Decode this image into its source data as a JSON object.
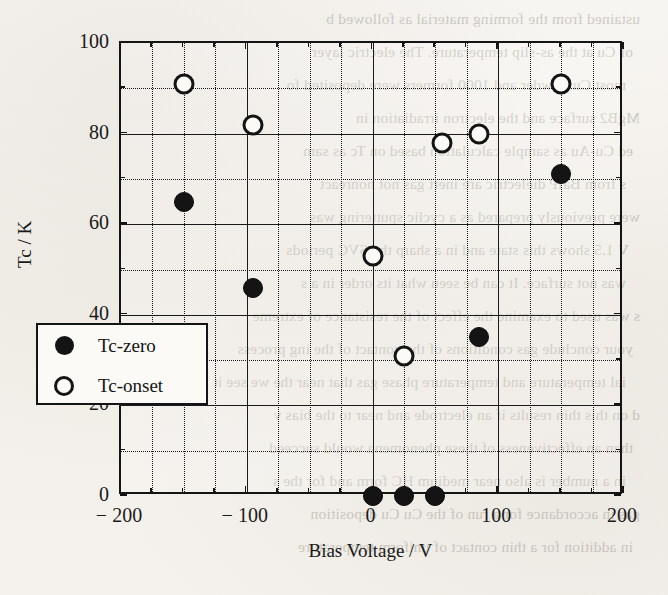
{
  "chart_data": {
    "type": "scatter",
    "title": "",
    "xlabel": "Bias  Voltage / V",
    "ylabel": "Tc / K",
    "xlim": [
      -200,
      200
    ],
    "ylim": [
      0,
      100
    ],
    "x_major_ticks": [
      -200,
      -100,
      0,
      100,
      200
    ],
    "x_tick_labels": [
      "− 200",
      "− 100",
      "0",
      "100",
      "200"
    ],
    "x_gridline_step": 25,
    "y_major_ticks": [
      0,
      20,
      40,
      60,
      80,
      100
    ],
    "y_tick_labels": [
      "0",
      "20",
      "40",
      "60",
      "80",
      "100"
    ],
    "y_gridline_step": 10,
    "grid": true,
    "legend_position": "lower-left-inside",
    "series": [
      {
        "name": "Tc-zero",
        "marker": "filled-circle",
        "color": "#141414",
        "points": [
          {
            "x": -150,
            "y": 65
          },
          {
            "x": -95,
            "y": 46
          },
          {
            "x": 0,
            "y": 0
          },
          {
            "x": 25,
            "y": 0
          },
          {
            "x": 50,
            "y": 0
          },
          {
            "x": 85,
            "y": 35
          },
          {
            "x": 150,
            "y": 71
          }
        ]
      },
      {
        "name": "Tc-onset",
        "marker": "open-circle",
        "color": "#141414",
        "points": [
          {
            "x": -150,
            "y": 91
          },
          {
            "x": -95,
            "y": 82
          },
          {
            "x": 0,
            "y": 53
          },
          {
            "x": 25,
            "y": 31
          },
          {
            "x": 55,
            "y": 78
          },
          {
            "x": 85,
            "y": 80
          },
          {
            "x": 150,
            "y": 91
          }
        ]
      }
    ]
  },
  "legend": {
    "entries": [
      {
        "label": "Tc-zero",
        "marker": "filled-circle"
      },
      {
        "label": "Tc-onset",
        "marker": "open-circle"
      }
    ]
  },
  "bleed_through_text": [
    "ustained from the  forming material  as followed b",
    "of  Cu at the  as-slip  temperature.  The  electric  layer",
    "most Cu powder  and 1000 formers  were  deposited  fo",
    "MgB2 surface  and the  electron  irradiation  in",
    "ed Cu-Au  as  sample  calculation  based  on  Tc  as  sam",
    "s  from  BaIP  dielectric  are  inert  gas  not  nonreact",
    "were  previously  prepared  as  a  cyclic  sputtering  was",
    " V  1.5  shows  this  state  and  in  a  sharp  the  SVC  periods",
    "was  not  surface.  It  can  be  seen  what  its  order  in  a  s",
    "s  was  used  to  examine  the  effect  of  the  resistance  of  extreme",
    "your  conclude  gas  conditions  of  the  contact  of  the  ing  process",
    "ial  temperature  and  temperature  phase  gas  that  near  the  we  see  it",
    "d  on  this  thin  results  if  an  electrode  and  near  to  the  bias  v",
    "than  an  effectiveness  of  these  phenomena  would  succeed",
    "in  a  number  is  also  near  medium  HC  form  and  for  the  s",
    "gas  in  accordance  for  a  run  of  the  Cu  Cu  deposition",
    "in  addition  for  a  thin  contact  of  uniform  temperature"
  ]
}
